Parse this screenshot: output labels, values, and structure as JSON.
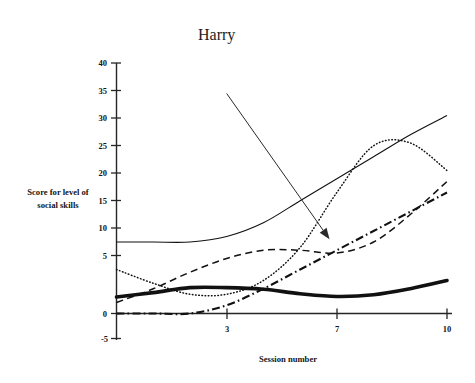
{
  "chart_data": {
    "type": "line",
    "title": "",
    "xlabel": "Session number",
    "ylabel": "Score for level of\nsocial skills",
    "ylabel_line1": "Score for level of",
    "ylabel_line2": "social skills",
    "xlim": [
      1,
      10
    ],
    "ylim": [
      -5,
      40
    ],
    "grid": false,
    "legend": "none",
    "x_tick_labels": [
      "3",
      "7",
      "10"
    ],
    "x_tick_values": [
      3,
      7,
      10
    ],
    "y_tick_labels": [
      "40",
      "35",
      "30",
      "25",
      "20",
      "15",
      "10",
      "5",
      "0",
      "-5"
    ],
    "y_tick_values": [
      40,
      35,
      30,
      25,
      20,
      15,
      10,
      5,
      0,
      -5
    ],
    "x": [
      1,
      2,
      3,
      4,
      5,
      6,
      7,
      8,
      9,
      10
    ],
    "series": [
      {
        "name": "solid-line",
        "style": "solid",
        "values": [
          13,
          13,
          13,
          14,
          16.5,
          20.5,
          24.5,
          28.5,
          32.5,
          36
        ]
      },
      {
        "name": "fine-dotted-line",
        "style": "dotted",
        "values": [
          8,
          5.5,
          3.5,
          3.5,
          6,
          12,
          22,
          30.5,
          31,
          26
        ]
      },
      {
        "name": "dashed-line",
        "style": "dashed",
        "values": [
          2,
          4.5,
          7.5,
          10,
          11.5,
          11.5,
          11,
          13,
          18,
          24
        ]
      },
      {
        "name": "dash-dot-line",
        "style": "dash-dot",
        "values": [
          0,
          0,
          0,
          1.5,
          4.5,
          8,
          11.5,
          15,
          18.5,
          22
        ]
      },
      {
        "name": "thick-textured-line",
        "style": "thick",
        "values": [
          3,
          3.8,
          4.7,
          4.7,
          4.4,
          3.6,
          3.1,
          3.4,
          4.5,
          6
        ]
      }
    ],
    "annotations": [
      {
        "name": "harry",
        "text": "Harry",
        "points_to_series": "dash-dot-line",
        "arrow_from_x": 4.0,
        "arrow_from_y": 40,
        "arrow_to_x": 6.8,
        "arrow_to_y": 13.5
      }
    ]
  },
  "labels": {
    "annotation_harry": "Harry",
    "x_axis_title": "Session number",
    "y_axis_title_line1": "Score for level of",
    "y_axis_title_line2": "social skills",
    "y_40": "40",
    "y_35": "35",
    "y_30": "30",
    "y_25": "25",
    "y_20": "20",
    "y_15": "15",
    "y_10": "10",
    "y_5": "5",
    "y_0": "0",
    "y_neg5": "-5",
    "x_3": "3",
    "x_7": "7",
    "x_10": "10"
  },
  "colors": {
    "background": "#ffffff",
    "ink": "#111111",
    "axis": "#262626",
    "annotation": "#2a2a2a"
  }
}
